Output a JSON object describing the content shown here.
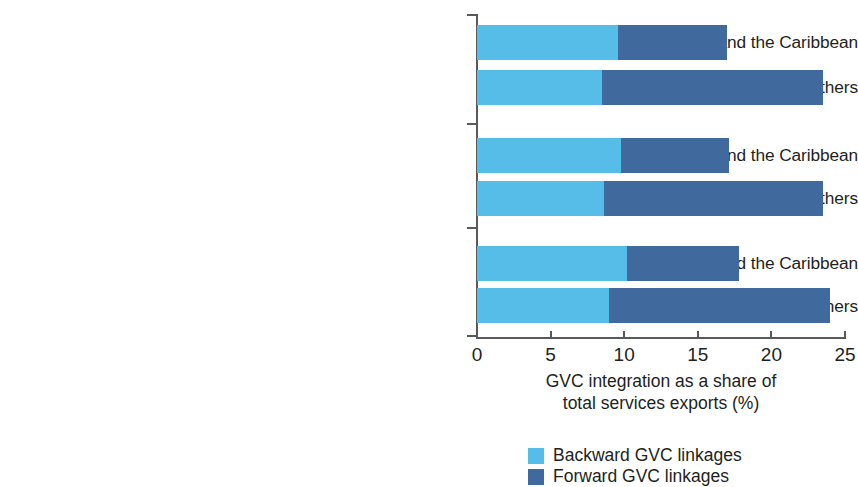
{
  "chart_data": {
    "type": "bar",
    "orientation": "horizontal",
    "stacked": true,
    "title": "",
    "xlabel": "GVC integration as a share of total services exports (%)",
    "xlabel_lines": [
      "GVC integration as a share of",
      "total services exports (%)"
    ],
    "ylabel": "",
    "xlim": [
      0,
      25
    ],
    "xticks": [
      0,
      5,
      10,
      15,
      20,
      25
    ],
    "xtick_labels": [
      "0",
      "5",
      "10",
      "15",
      "20",
      "25"
    ],
    "grid": false,
    "legend_position": "bottom",
    "categories": [
      "Observed, Latin America and the Caribbean",
      "Observed, Others",
      "Scenario 1, Latin America and the Caribbean",
      "Scenario 1, Others",
      "Scenario 2, Latin America and the Caribbean",
      "Scenario 2, Others"
    ],
    "series": [
      {
        "name": "Backward GVC linkages",
        "color": "#56bce8",
        "values": [
          9.6,
          8.5,
          9.8,
          8.6,
          10.2,
          9.0
        ]
      },
      {
        "name": "Forward GVC linkages",
        "color": "#40699e",
        "values": [
          7.4,
          15.0,
          7.3,
          14.9,
          7.6,
          15.0
        ]
      }
    ],
    "totals": [
      17.0,
      23.5,
      17.1,
      23.5,
      17.8,
      24.0
    ],
    "groups": [
      "Observed",
      "Scenario 1",
      "Scenario 2"
    ]
  },
  "legend": {
    "items": [
      {
        "label": "Backward GVC linkages",
        "color": "#56bce8"
      },
      {
        "label": "Forward GVC linkages",
        "color": "#40699e"
      }
    ]
  },
  "axis": {
    "title_line1": "GVC integration as a share of",
    "title_line2": "total services exports (%)",
    "ticks": [
      "0",
      "5",
      "10",
      "15",
      "20",
      "25"
    ]
  },
  "labels": [
    "Observed, Latin America and the Caribbean",
    "Observed, Others",
    "Scenario 1, Latin America and the Caribbean",
    "Scenario 1, Others",
    "Scenario 2, Latin America and the Caribbean",
    "Scenario 2, Others"
  ],
  "colors": {
    "backward": "#56bce8",
    "forward": "#40699e",
    "axis": "#58595b",
    "text": "#231f20",
    "background": "#ffffff"
  }
}
